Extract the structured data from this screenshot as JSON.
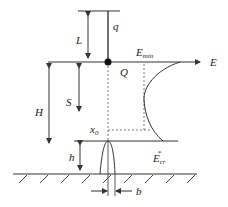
{
  "diagram": {
    "labels": {
      "q": "q",
      "L": "L",
      "E_min": "E",
      "E_min_sub": "min",
      "E": "E",
      "Q": "Q",
      "H": "H",
      "S": "S",
      "x0": "x",
      "x0_sub": "0",
      "h": "h",
      "Ecr": "E",
      "Ecr_sub": "cr",
      "Ecr_sup": "*",
      "b": "b"
    },
    "colors": {
      "line": "#333333",
      "dashed": "#555555"
    }
  }
}
